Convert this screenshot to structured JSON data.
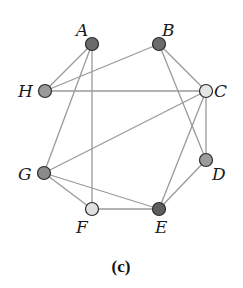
{
  "figure": {
    "caption": "(c)",
    "nodes": [
      {
        "id": "A",
        "label": "A",
        "x": 92,
        "y": 44,
        "fill": "#6b6b6b",
        "label_x": 76,
        "label_y": 36
      },
      {
        "id": "B",
        "label": "B",
        "x": 159,
        "y": 44,
        "fill": "#6b6b6b",
        "label_x": 162,
        "label_y": 36
      },
      {
        "id": "C",
        "label": "C",
        "x": 206,
        "y": 91,
        "fill": "#e6e6e6",
        "label_x": 214,
        "label_y": 97
      },
      {
        "id": "D",
        "label": "D",
        "x": 206,
        "y": 160,
        "fill": "#9c9c9c",
        "label_x": 212,
        "label_y": 180
      },
      {
        "id": "E",
        "label": "E",
        "x": 159,
        "y": 209,
        "fill": "#5e5e5e",
        "label_x": 155,
        "label_y": 233
      },
      {
        "id": "F",
        "label": "F",
        "x": 92,
        "y": 209,
        "fill": "#e0e0e0",
        "label_x": 76,
        "label_y": 233
      },
      {
        "id": "G",
        "label": "G",
        "x": 44,
        "y": 173,
        "fill": "#8a8a8a",
        "label_x": 18,
        "label_y": 180
      },
      {
        "id": "H",
        "label": "H",
        "x": 45,
        "y": 91,
        "fill": "#9a9a9a",
        "label_x": 18,
        "label_y": 97
      }
    ],
    "edges": [
      [
        "A",
        "H"
      ],
      [
        "A",
        "G"
      ],
      [
        "A",
        "F"
      ],
      [
        "B",
        "H"
      ],
      [
        "B",
        "C"
      ],
      [
        "B",
        "D"
      ],
      [
        "H",
        "C"
      ],
      [
        "C",
        "G"
      ],
      [
        "C",
        "E"
      ],
      [
        "C",
        "D"
      ],
      [
        "G",
        "F"
      ],
      [
        "G",
        "E"
      ],
      [
        "D",
        "E"
      ],
      [
        "F",
        "E"
      ]
    ],
    "colors": {
      "edge": "#9a9a9a",
      "node_stroke": "#2b2b2b",
      "text": "#1a1a1a"
    }
  }
}
